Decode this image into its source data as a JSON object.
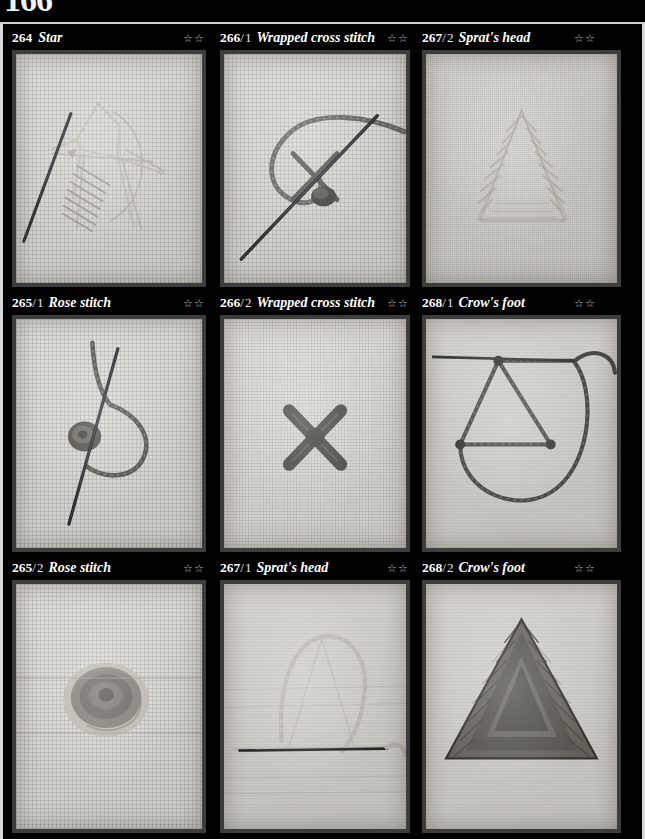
{
  "page": {
    "number": "166",
    "background_color": "#000000",
    "text_color": "#ffffff",
    "frame_color": "#d8d8d8"
  },
  "rating_glyph": "☆☆",
  "grid": {
    "columns": 3,
    "rows": 3,
    "cells": [
      {
        "id": "264",
        "number": "264",
        "variant": "",
        "separator": "",
        "name": "Star",
        "rating": "☆☆",
        "rating_count": 2,
        "fabric": "aida",
        "photo_description": "needle with pale thread forming a star stitch on cream aida cloth"
      },
      {
        "id": "266-1",
        "number": "266",
        "variant": "1",
        "separator": "/",
        "name": "Wrapped cross stitch",
        "rating": "☆☆",
        "rating_count": 2,
        "fabric": "aida",
        "photo_description": "needle and looped thread wrapping a cross stitch on white aida cloth"
      },
      {
        "id": "267-2",
        "number": "267",
        "variant": "2",
        "separator": "/",
        "name": "Sprat's head",
        "rating": "☆☆",
        "rating_count": 2,
        "fabric": "linen",
        "photo_description": "finished pale triangular sprat's head stitch on cream linen"
      },
      {
        "id": "265-1",
        "number": "265",
        "variant": "1",
        "separator": "/",
        "name": "Rose stitch",
        "rating": "☆☆",
        "rating_count": 2,
        "fabric": "aida",
        "photo_description": "needle with dark curved thread beginning a rose stitch on aida cloth"
      },
      {
        "id": "266-2",
        "number": "266",
        "variant": "2",
        "separator": "/",
        "name": "Wrapped cross stitch",
        "rating": "☆☆",
        "rating_count": 2,
        "fabric": "aida-fine",
        "photo_description": "completed dark wrapped cross stitch on white aida cloth"
      },
      {
        "id": "268-1",
        "number": "268",
        "variant": "1",
        "separator": "/",
        "name": "Crow's foot",
        "rating": "☆☆",
        "rating_count": 2,
        "fabric": "plain",
        "photo_description": "dark thread triangle outline with trailing loop forming a crow's foot"
      },
      {
        "id": "265-2",
        "number": "265",
        "variant": "2",
        "separator": "/",
        "name": "Rose stitch",
        "rating": "☆☆",
        "rating_count": 2,
        "fabric": "aida",
        "photo_description": "completed coiled rose stitch in grey and cream thread on aida cloth"
      },
      {
        "id": "267-1",
        "number": "267",
        "variant": "1",
        "separator": "/",
        "name": "Sprat's head",
        "rating": "☆☆",
        "rating_count": 2,
        "fabric": "plain",
        "photo_description": "needle and pale looping thread starting a sprat's head on plain cloth"
      },
      {
        "id": "268-2",
        "number": "268",
        "variant": "2",
        "separator": "/",
        "name": "Crow's foot",
        "rating": "☆☆",
        "rating_count": 2,
        "fabric": "plain",
        "photo_description": "completed densely filled dark triangular crow's foot stitch"
      }
    ]
  }
}
